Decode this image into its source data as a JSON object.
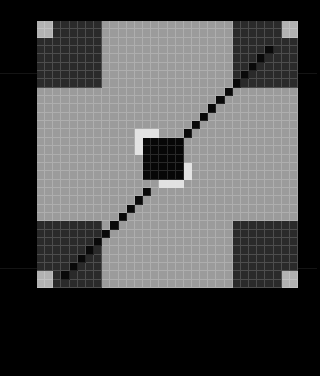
{
  "view": {
    "title": "grid-matrix-visualization",
    "canvas_width": 317,
    "canvas_height": 376,
    "background_color": "#000000"
  },
  "matrix": {
    "name": "matrix-grid",
    "rows": 32,
    "cols": 32,
    "origin_x": 37,
    "origin_y": 21,
    "pixel_width": 261,
    "pixel_height": 267,
    "grid_lines": true,
    "gridline_color": "#bebebe",
    "palette": {
      "bg": "#9b9b9b",
      "dark": "#2a2a2a",
      "black": "#070707",
      "light": "#b2b2b2",
      "white": "#e2e2e2",
      "diag": "#090909"
    },
    "legend": [
      {
        "key": "bg",
        "label": "mid-gray background",
        "color": "#9b9b9b"
      },
      {
        "key": "dark",
        "label": "dark corner block",
        "color": "#2a2a2a"
      },
      {
        "key": "black",
        "label": "black center block",
        "color": "#070707"
      },
      {
        "key": "light",
        "label": "light corner marker",
        "color": "#b2b2b2"
      },
      {
        "key": "white",
        "label": "white center marker",
        "color": "#e2e2e2"
      },
      {
        "key": "diag",
        "label": "anti-diagonal cell",
        "color": "#090909"
      }
    ],
    "regions": [
      {
        "name": "corner-block-top-left",
        "type": "dark",
        "row": 0,
        "col": 0,
        "height": 8,
        "width": 8
      },
      {
        "name": "corner-marker-top-left",
        "type": "light",
        "row": 0,
        "col": 0,
        "height": 2,
        "width": 2
      },
      {
        "name": "corner-block-top-right",
        "type": "dark",
        "row": 0,
        "col": 24,
        "height": 8,
        "width": 8
      },
      {
        "name": "corner-marker-top-right",
        "type": "light",
        "row": 0,
        "col": 30,
        "height": 2,
        "width": 2
      },
      {
        "name": "corner-block-bottom-left",
        "type": "dark",
        "row": 24,
        "col": 0,
        "height": 8,
        "width": 8
      },
      {
        "name": "corner-marker-bottom-left",
        "type": "light",
        "row": 30,
        "col": 0,
        "height": 2,
        "width": 2
      },
      {
        "name": "corner-block-bottom-right",
        "type": "dark",
        "row": 24,
        "col": 24,
        "height": 8,
        "width": 8
      },
      {
        "name": "corner-marker-bottom-right",
        "type": "light",
        "row": 30,
        "col": 30,
        "height": 2,
        "width": 2
      },
      {
        "name": "center-block",
        "type": "black",
        "row": 14,
        "col": 13,
        "height": 5,
        "width": 5
      },
      {
        "name": "center-marker-upper-left",
        "type": "white",
        "row": 13,
        "col": 12,
        "height": 1,
        "width": 3
      },
      {
        "name": "center-marker-upper-left-2",
        "type": "white",
        "row": 14,
        "col": 12,
        "height": 2,
        "width": 1
      },
      {
        "name": "center-marker-lower-right",
        "type": "white",
        "row": 19,
        "col": 15,
        "height": 1,
        "width": 3
      },
      {
        "name": "center-marker-lower-right-2",
        "type": "white",
        "row": 17,
        "col": 18,
        "height": 2,
        "width": 1
      }
    ],
    "antidiagonal": {
      "name": "anti-diagonal-line",
      "description": "single black cell per row running from lower-left to upper-right",
      "cells": [
        {
          "row": 3,
          "col": 28
        },
        {
          "row": 4,
          "col": 27
        },
        {
          "row": 5,
          "col": 26
        },
        {
          "row": 6,
          "col": 25
        },
        {
          "row": 7,
          "col": 24
        },
        {
          "row": 8,
          "col": 23
        },
        {
          "row": 9,
          "col": 22
        },
        {
          "row": 10,
          "col": 21
        },
        {
          "row": 11,
          "col": 20
        },
        {
          "row": 12,
          "col": 19
        },
        {
          "row": 13,
          "col": 18
        },
        {
          "row": 20,
          "col": 13
        },
        {
          "row": 21,
          "col": 12
        },
        {
          "row": 22,
          "col": 11
        },
        {
          "row": 23,
          "col": 10
        },
        {
          "row": 24,
          "col": 9
        },
        {
          "row": 25,
          "col": 8
        },
        {
          "row": 26,
          "col": 7
        },
        {
          "row": 27,
          "col": 6
        },
        {
          "row": 28,
          "col": 5
        },
        {
          "row": 29,
          "col": 4
        },
        {
          "row": 30,
          "col": 3
        }
      ]
    },
    "seams": [
      {
        "name": "seam-upper",
        "y": 73
      },
      {
        "name": "seam-lower",
        "y": 268
      }
    ]
  }
}
